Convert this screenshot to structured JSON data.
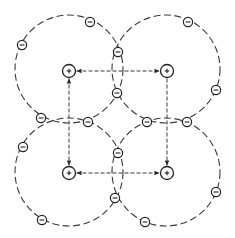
{
  "figure": {
    "colors": {
      "line": "#3a3a3a",
      "ion": "#222222",
      "background": "#ffffff"
    },
    "ions": [
      {
        "id": "top-left",
        "charge": "+",
        "x": 69,
        "y": 71
      },
      {
        "id": "top-right",
        "charge": "+",
        "x": 167,
        "y": 71
      },
      {
        "id": "bottom-left",
        "charge": "+",
        "x": 69,
        "y": 173
      },
      {
        "id": "bottom-right",
        "charge": "+",
        "x": 167,
        "y": 173
      }
    ],
    "orbits": [
      {
        "id": "top-left",
        "cx": 69,
        "cy": 69,
        "r": 54
      },
      {
        "id": "top-right",
        "cx": 166,
        "cy": 69,
        "r": 54
      },
      {
        "id": "bottom-left",
        "cx": 69,
        "cy": 172,
        "r": 54
      },
      {
        "id": "bottom-right",
        "cx": 166,
        "cy": 172,
        "r": 54
      }
    ],
    "electrons": [
      {
        "charge": "-",
        "x": 90,
        "y": 22
      },
      {
        "charge": "-",
        "x": 188,
        "y": 22
      },
      {
        "charge": "-",
        "x": 22,
        "y": 45
      },
      {
        "charge": "-",
        "x": 118,
        "y": 52
      },
      {
        "charge": "-",
        "x": 216,
        "y": 90
      },
      {
        "charge": "-",
        "x": 117,
        "y": 93
      },
      {
        "charge": "-",
        "x": 41,
        "y": 118
      },
      {
        "charge": "-",
        "x": 88,
        "y": 122
      },
      {
        "charge": "-",
        "x": 147,
        "y": 122
      },
      {
        "charge": "-",
        "x": 187,
        "y": 122
      },
      {
        "charge": "-",
        "x": 23,
        "y": 147
      },
      {
        "charge": "-",
        "x": 118,
        "y": 153
      },
      {
        "charge": "-",
        "x": 216,
        "y": 192
      },
      {
        "charge": "-",
        "x": 115,
        "y": 198
      },
      {
        "charge": "-",
        "x": 42,
        "y": 220
      },
      {
        "charge": "-",
        "x": 145,
        "y": 222
      }
    ],
    "bonds": [
      {
        "id": "top",
        "from": "top-left",
        "to": "top-right",
        "arrows": [
          "start",
          "end"
        ]
      },
      {
        "id": "bottom",
        "from": "bottom-left",
        "to": "bottom-right",
        "arrows": [
          "start",
          "end"
        ]
      },
      {
        "id": "left",
        "from": "top-left",
        "to": "bottom-left",
        "arrows": [
          "start",
          "end"
        ]
      },
      {
        "id": "right",
        "from": "top-right",
        "to": "bottom-right",
        "arrows": [
          "end"
        ]
      }
    ]
  }
}
